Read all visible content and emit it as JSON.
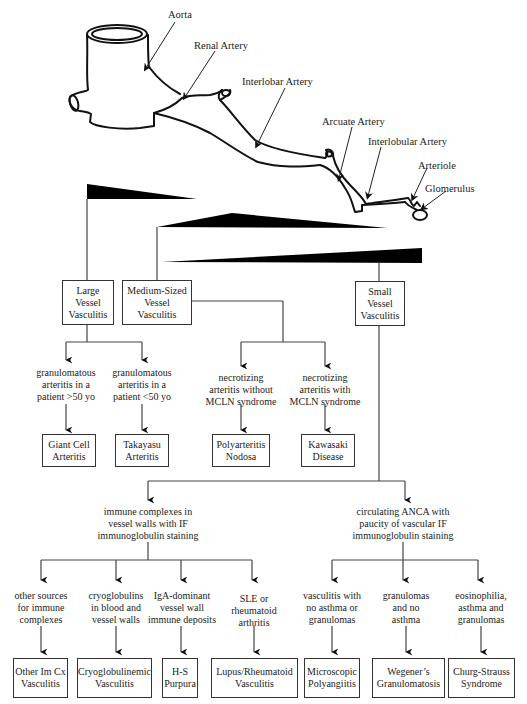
{
  "anatomy": {
    "labels": {
      "aorta": "Aorta",
      "renal_artery": "Renal Artery",
      "interlobar_artery": "Interlobar Artery",
      "arcuate_artery": "Arcuate Artery",
      "interlobular_artery": "Interlobular Artery",
      "arteriole": "Arteriole",
      "glomerulus": "Glomerulus"
    }
  },
  "categories": {
    "large": {
      "line1": "Large",
      "line2": "Vessel",
      "line3": "Vasculitis"
    },
    "medium": {
      "line1": "Medium-Sized",
      "line2": "Vessel",
      "line3": "Vasculitis"
    },
    "small": {
      "line1": "Small",
      "line2": "Vessel",
      "line3": "Vasculitis"
    }
  },
  "large_branches": [
    {
      "criteria": [
        "granulomatous",
        "arteritis in a",
        "patient >50 yo"
      ],
      "disease": [
        "Giant Cell",
        "Arteritis"
      ]
    },
    {
      "criteria": [
        "granulomatous",
        "arteritis in a",
        "patient <50 yo"
      ],
      "disease": [
        "Takayasu",
        "Arteritis"
      ]
    }
  ],
  "medium_branches": [
    {
      "criteria": [
        "necrotizing",
        "arteritis without",
        "MCLN syndrome"
      ],
      "disease": [
        "Polyarteritis",
        "Nodosa"
      ]
    },
    {
      "criteria": [
        "necrotizing",
        "arteritis with",
        "MCLN syndrome"
      ],
      "disease": [
        "Kawasaki",
        "Disease"
      ]
    }
  ],
  "small_groups": {
    "immune_complex": {
      "criteria": [
        "immune complexes in",
        "vessel walls with IF",
        "immunoglobulin staining"
      ],
      "branches": [
        {
          "criteria": [
            "other sources",
            "for immune",
            "complexes"
          ],
          "disease": [
            "Other Im Cx",
            "Vasculitis"
          ]
        },
        {
          "criteria": [
            "cryoglobulins",
            "in blood and",
            "vessel walls"
          ],
          "disease": [
            "Cryoglobulinemic",
            "Vasculitis"
          ]
        },
        {
          "criteria": [
            "IgA-dominant",
            "vessel wall",
            "immune deposits"
          ],
          "disease": [
            "H-S",
            "Purpura"
          ]
        },
        {
          "criteria": [
            "SLE or",
            "rheumatoid",
            "arthritis"
          ],
          "disease": [
            "Lupus/Rheumatoid",
            "Vasculitis"
          ]
        }
      ]
    },
    "anca": {
      "criteria": [
        "circulating ANCA with",
        "paucity of vascular IF",
        "immunoglobulin staining"
      ],
      "branches": [
        {
          "criteria": [
            "vasculitis with",
            "no asthma or",
            "granulomas"
          ],
          "disease": [
            "Microscopic",
            "Polyangiitis"
          ]
        },
        {
          "criteria": [
            "granulomas",
            "and no",
            "asthma"
          ],
          "disease": [
            "Wegener’s",
            "Granulomatosis"
          ]
        },
        {
          "criteria": [
            "eosinophilia,",
            "asthma and",
            "granulomas"
          ],
          "disease": [
            "Churg-Strauss",
            "Syndrome"
          ]
        }
      ]
    }
  },
  "colors": {
    "line": "#333333",
    "wedge": "#000000",
    "text": "#222222"
  }
}
